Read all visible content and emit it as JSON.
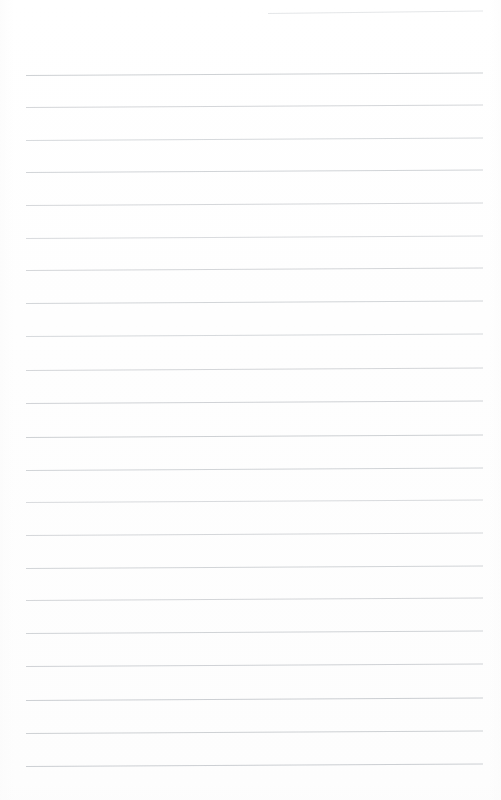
{
  "document": {
    "kind": "scanned-blank-ruled-notebook-page",
    "page_width": 501,
    "page_height": 800,
    "background_color": "#fefefe",
    "written_content": "",
    "visible_text": ""
  },
  "ruling": {
    "line_color": "#b9bdc2",
    "line_color_faint": "#ced2d6",
    "line_thickness_px": 1,
    "left_margin_x": 26,
    "right_end_x": 483,
    "line_spacing_px": 32.5,
    "tilt_rise_px": -2.5,
    "line_count": 23,
    "lines": [
      {
        "id": "rule-00",
        "y_left": 13,
        "x_start": 268,
        "x_end": 483,
        "opacity": 0.55,
        "partial": true
      },
      {
        "id": "rule-01",
        "y_left": 75,
        "x_start": 26,
        "x_end": 483,
        "opacity": 0.7,
        "partial": false
      },
      {
        "id": "rule-02",
        "y_left": 107,
        "x_start": 26,
        "x_end": 483,
        "opacity": 0.62,
        "partial": false
      },
      {
        "id": "rule-03",
        "y_left": 140,
        "x_start": 26,
        "x_end": 483,
        "opacity": 0.58,
        "partial": false
      },
      {
        "id": "rule-04",
        "y_left": 172,
        "x_start": 26,
        "x_end": 483,
        "opacity": 0.66,
        "partial": false
      },
      {
        "id": "rule-05",
        "y_left": 205,
        "x_start": 26,
        "x_end": 483,
        "opacity": 0.6,
        "partial": false
      },
      {
        "id": "rule-06",
        "y_left": 238,
        "x_start": 26,
        "x_end": 483,
        "opacity": 0.55,
        "partial": false
      },
      {
        "id": "rule-07",
        "y_left": 270,
        "x_start": 26,
        "x_end": 483,
        "opacity": 0.62,
        "partial": false
      },
      {
        "id": "rule-08",
        "y_left": 303,
        "x_start": 26,
        "x_end": 483,
        "opacity": 0.64,
        "partial": false
      },
      {
        "id": "rule-09",
        "y_left": 336,
        "x_start": 26,
        "x_end": 483,
        "opacity": 0.58,
        "partial": false
      },
      {
        "id": "rule-10",
        "y_left": 370,
        "x_start": 26,
        "x_end": 483,
        "opacity": 0.62,
        "partial": false
      },
      {
        "id": "rule-11",
        "y_left": 403,
        "x_start": 26,
        "x_end": 483,
        "opacity": 0.68,
        "partial": false
      },
      {
        "id": "rule-12",
        "y_left": 437,
        "x_start": 26,
        "x_end": 483,
        "opacity": 0.7,
        "partial": false
      },
      {
        "id": "rule-13",
        "y_left": 470,
        "x_start": 26,
        "x_end": 483,
        "opacity": 0.66,
        "partial": false
      },
      {
        "id": "rule-14",
        "y_left": 502,
        "x_start": 26,
        "x_end": 483,
        "opacity": 0.55,
        "partial": false
      },
      {
        "id": "rule-15",
        "y_left": 535,
        "x_start": 26,
        "x_end": 483,
        "opacity": 0.6,
        "partial": false
      },
      {
        "id": "rule-16",
        "y_left": 568,
        "x_start": 26,
        "x_end": 483,
        "opacity": 0.64,
        "partial": false
      },
      {
        "id": "rule-17",
        "y_left": 600,
        "x_start": 26,
        "x_end": 483,
        "opacity": 0.62,
        "partial": false
      },
      {
        "id": "rule-18",
        "y_left": 633,
        "x_start": 26,
        "x_end": 483,
        "opacity": 0.66,
        "partial": false
      },
      {
        "id": "rule-19",
        "y_left": 666,
        "x_start": 26,
        "x_end": 483,
        "opacity": 0.68,
        "partial": false
      },
      {
        "id": "rule-20",
        "y_left": 700,
        "x_start": 26,
        "x_end": 483,
        "opacity": 0.72,
        "partial": false
      },
      {
        "id": "rule-21",
        "y_left": 733,
        "x_start": 26,
        "x_end": 483,
        "opacity": 0.7,
        "partial": false
      },
      {
        "id": "rule-22",
        "y_left": 766,
        "x_start": 26,
        "x_end": 483,
        "opacity": 0.72,
        "partial": false
      }
    ]
  }
}
